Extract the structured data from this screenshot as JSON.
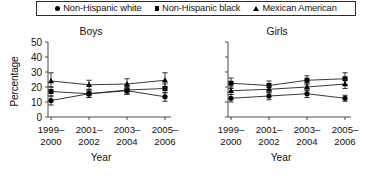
{
  "legend": {
    "position": "top-center-boxed",
    "entries": [
      {
        "marker": "circle-marker-icon",
        "label": "Non-Hispanic white"
      },
      {
        "marker": "square-marker-icon",
        "label": "Non-Hispanic black"
      },
      {
        "marker": "triangle-marker-icon",
        "label": "Mexican American"
      }
    ]
  },
  "axes": {
    "ylabel": "Percentage",
    "xlabel": "Year",
    "yticks": [
      "50",
      "40",
      "30",
      "20",
      "10",
      "0"
    ],
    "xticks": [
      {
        "line1": "1999–",
        "line2": "2000"
      },
      {
        "line1": "2001–",
        "line2": "2002"
      },
      {
        "line1": "2003–",
        "line2": "2004"
      },
      {
        "line1": "2005–",
        "line2": "2006"
      }
    ]
  },
  "panels": [
    {
      "key": "boys",
      "title": "Boys",
      "show_ytick_labels": true
    },
    {
      "key": "girls",
      "title": "Girls",
      "show_ytick_labels": false
    }
  ],
  "chart_data": [
    {
      "type": "line",
      "title": "Boys",
      "xlabel": "Year",
      "ylabel": "Percentage",
      "ylim": [
        0,
        50
      ],
      "ytick_values": [
        0,
        10,
        20,
        30,
        40,
        50
      ],
      "grid": false,
      "legend_position": "top",
      "categories": [
        "1999–2000",
        "2001–2002",
        "2003–2004",
        "2005–2006"
      ],
      "series": [
        {
          "name": "Non-Hispanic white",
          "marker": "circle",
          "values": [
            11.0,
            15.5,
            17.5,
            13.5
          ],
          "err_low": [
            8.0,
            13.0,
            15.0,
            10.5
          ],
          "err_high": [
            14.0,
            18.0,
            20.0,
            16.5
          ]
        },
        {
          "name": "Non-Hispanic black",
          "marker": "square",
          "values": [
            17.0,
            15.5,
            18.0,
            19.0
          ],
          "err_low": [
            14.0,
            13.0,
            15.5,
            16.0
          ],
          "err_high": [
            20.0,
            18.0,
            20.5,
            22.0
          ]
        },
        {
          "name": "Mexican American",
          "marker": "triangle",
          "values": [
            24.0,
            21.5,
            22.0,
            24.5
          ],
          "err_low": [
            20.0,
            18.5,
            19.0,
            20.0
          ],
          "err_high": [
            29.5,
            24.5,
            25.5,
            29.5
          ]
        }
      ]
    },
    {
      "type": "line",
      "title": "Girls",
      "xlabel": "Year",
      "ylabel": "Percentage",
      "ylim": [
        0,
        50
      ],
      "ytick_values": [
        0,
        10,
        20,
        30,
        40,
        50
      ],
      "grid": false,
      "legend_position": "top",
      "categories": [
        "1999–2000",
        "2001–2002",
        "2003–2004",
        "2005–2006"
      ],
      "series": [
        {
          "name": "Non-Hispanic white",
          "marker": "circle",
          "values": [
            12.5,
            14.0,
            15.5,
            12.5
          ],
          "err_low": [
            10.0,
            11.5,
            13.0,
            10.5
          ],
          "err_high": [
            15.0,
            16.5,
            18.0,
            14.5
          ]
        },
        {
          "name": "Non-Hispanic black",
          "marker": "square",
          "values": [
            22.5,
            21.0,
            24.5,
            25.5
          ],
          "err_low": [
            19.0,
            18.0,
            21.5,
            21.5
          ],
          "err_high": [
            26.0,
            24.0,
            27.5,
            29.5
          ]
        },
        {
          "name": "Mexican American",
          "marker": "triangle",
          "values": [
            17.5,
            18.5,
            20.0,
            22.0
          ],
          "err_low": [
            15.0,
            16.0,
            17.5,
            19.0
          ],
          "err_high": [
            20.0,
            21.0,
            22.5,
            25.0
          ]
        }
      ]
    }
  ]
}
